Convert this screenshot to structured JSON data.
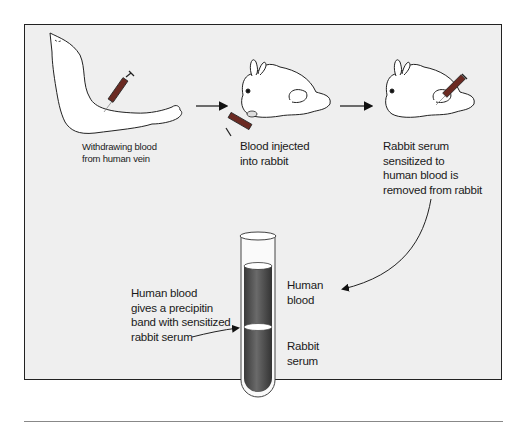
{
  "diagram": {
    "type": "process-flow",
    "steps": [
      {
        "id": "step-1",
        "lines": [
          "Withdrawing blood",
          "from human vein"
        ]
      },
      {
        "id": "step-2",
        "lines": [
          "Blood injected",
          "into rabbit"
        ]
      },
      {
        "id": "step-3",
        "lines": [
          "Rabbit serum",
          "sensitized to",
          "human blood is",
          "removed from rabbit"
        ]
      }
    ],
    "test_tube": {
      "layers": [
        {
          "id": "upper",
          "lines": [
            "Human",
            "blood"
          ]
        },
        {
          "id": "lower",
          "lines": [
            "Rabbit",
            "serum"
          ]
        }
      ],
      "band_callout": {
        "lines": [
          "Human blood",
          "gives a precipitin",
          "band with sensitized",
          "rabbit serum"
        ]
      }
    },
    "colors": {
      "panel_background": "#efefef",
      "panel_border": "#222222",
      "liquid": "#555555",
      "stroke": "#222222",
      "syringe_barrel": "#6b2a22"
    }
  }
}
